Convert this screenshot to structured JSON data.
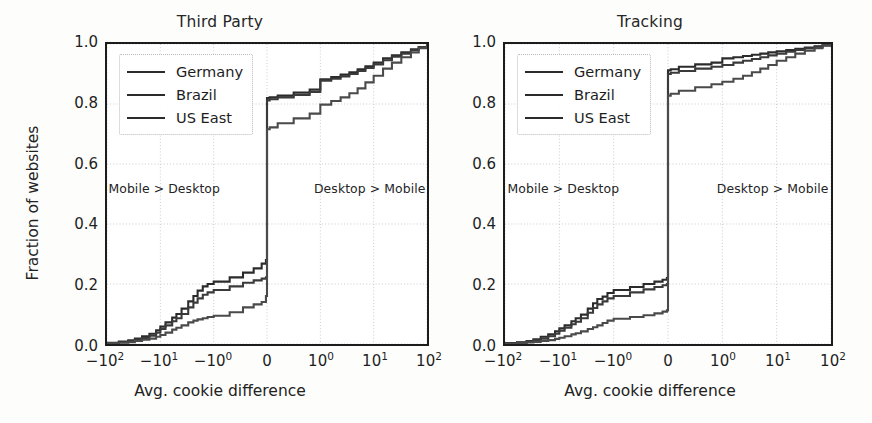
{
  "figure": {
    "width": 872,
    "height": 423,
    "background": "#fdfdfc"
  },
  "chart_data": [
    {
      "type": "line",
      "title": "Third Party",
      "xlabel": "Avg. cookie difference",
      "ylabel": "Fraction of websites",
      "xscale": "symlog",
      "ylim": [
        0.0,
        1.0
      ],
      "xlim": [
        -100,
        100
      ],
      "grid": true,
      "legend_position": "upper left",
      "xticklabels": [
        "−10²",
        "−10¹",
        "−10⁰",
        "0",
        "10⁰",
        "10¹",
        "10²"
      ],
      "xtickvalues": [
        -100,
        -10,
        -1,
        0,
        1,
        10,
        100
      ],
      "yticklabels": [
        "0.0",
        "0.2",
        "0.4",
        "0.6",
        "0.8",
        "1.0"
      ],
      "ytickvalues": [
        0.0,
        0.2,
        0.4,
        0.6,
        0.8,
        1.0
      ],
      "annotations": [
        {
          "text": "Mobile > Desktop",
          "x": -8,
          "y": 0.52
        },
        {
          "text": "Desktop > Mobile",
          "x": 8,
          "y": 0.52
        }
      ],
      "series": [
        {
          "name": "Germany",
          "color": "#2b2b2b",
          "linestyle": "solid",
          "points": [
            [
              -100,
              0.004
            ],
            [
              -60,
              0.008
            ],
            [
              -40,
              0.012
            ],
            [
              -30,
              0.018
            ],
            [
              -22,
              0.026
            ],
            [
              -16,
              0.034
            ],
            [
              -12,
              0.046
            ],
            [
              -10,
              0.058
            ],
            [
              -8,
              0.072
            ],
            [
              -6,
              0.088
            ],
            [
              -5,
              0.1
            ],
            [
              -4,
              0.118
            ],
            [
              -3,
              0.142
            ],
            [
              -2.4,
              0.16
            ],
            [
              -2.0,
              0.178
            ],
            [
              -1.6,
              0.192
            ],
            [
              -1.3,
              0.2
            ],
            [
              -1.0,
              0.208
            ],
            [
              -0.7,
              0.222
            ],
            [
              -0.45,
              0.238
            ],
            [
              -0.25,
              0.252
            ],
            [
              -0.1,
              0.268
            ],
            [
              -0.02,
              0.28
            ],
            [
              0,
              0.82
            ],
            [
              0.05,
              0.822
            ],
            [
              0.2,
              0.828
            ],
            [
              0.5,
              0.838
            ],
            [
              0.8,
              0.848
            ],
            [
              1.0,
              0.882
            ],
            [
              1.6,
              0.89
            ],
            [
              2.4,
              0.898
            ],
            [
              3.5,
              0.906
            ],
            [
              5,
              0.916
            ],
            [
              7,
              0.926
            ],
            [
              10,
              0.938
            ],
            [
              15,
              0.952
            ],
            [
              22,
              0.962
            ],
            [
              33,
              0.972
            ],
            [
              50,
              0.982
            ],
            [
              70,
              0.99
            ],
            [
              100,
              1.0
            ]
          ]
        },
        {
          "name": "Brazil",
          "color": "#3a3a3a",
          "linestyle": "solid",
          "points": [
            [
              -100,
              0.003
            ],
            [
              -60,
              0.006
            ],
            [
              -40,
              0.01
            ],
            [
              -30,
              0.014
            ],
            [
              -22,
              0.02
            ],
            [
              -16,
              0.028
            ],
            [
              -12,
              0.038
            ],
            [
              -10,
              0.05
            ],
            [
              -8,
              0.062
            ],
            [
              -6,
              0.076
            ],
            [
              -5,
              0.086
            ],
            [
              -4,
              0.1
            ],
            [
              -3,
              0.122
            ],
            [
              -2.4,
              0.138
            ],
            [
              -2.0,
              0.152
            ],
            [
              -1.6,
              0.164
            ],
            [
              -1.3,
              0.172
            ],
            [
              -1.0,
              0.18
            ],
            [
              -0.7,
              0.192
            ],
            [
              -0.45,
              0.204
            ],
            [
              -0.25,
              0.212
            ],
            [
              -0.1,
              0.218
            ],
            [
              -0.02,
              0.222
            ],
            [
              0,
              0.812
            ],
            [
              0.05,
              0.816
            ],
            [
              0.2,
              0.822
            ],
            [
              0.5,
              0.83
            ],
            [
              0.8,
              0.84
            ],
            [
              1.0,
              0.878
            ],
            [
              1.6,
              0.884
            ],
            [
              2.4,
              0.892
            ],
            [
              3.5,
              0.9
            ],
            [
              5,
              0.91
            ],
            [
              7,
              0.92
            ],
            [
              10,
              0.932
            ],
            [
              15,
              0.946
            ],
            [
              22,
              0.958
            ],
            [
              33,
              0.968
            ],
            [
              50,
              0.98
            ],
            [
              70,
              0.99
            ],
            [
              100,
              1.0
            ]
          ]
        },
        {
          "name": "US East",
          "color": "#4a4a4a",
          "linestyle": "solid",
          "points": [
            [
              -100,
              0.002
            ],
            [
              -60,
              0.004
            ],
            [
              -40,
              0.006
            ],
            [
              -30,
              0.01
            ],
            [
              -22,
              0.014
            ],
            [
              -16,
              0.018
            ],
            [
              -12,
              0.024
            ],
            [
              -10,
              0.03
            ],
            [
              -8,
              0.038
            ],
            [
              -6,
              0.048
            ],
            [
              -5,
              0.054
            ],
            [
              -4,
              0.062
            ],
            [
              -3,
              0.072
            ],
            [
              -2.4,
              0.078
            ],
            [
              -2.0,
              0.082
            ],
            [
              -1.6,
              0.086
            ],
            [
              -1.3,
              0.09
            ],
            [
              -1.0,
              0.094
            ],
            [
              -0.7,
              0.106
            ],
            [
              -0.45,
              0.122
            ],
            [
              -0.25,
              0.132
            ],
            [
              -0.1,
              0.14
            ],
            [
              -0.02,
              0.16
            ],
            [
              0,
              0.716
            ],
            [
              0.05,
              0.722
            ],
            [
              0.2,
              0.736
            ],
            [
              0.5,
              0.752
            ],
            [
              0.8,
              0.768
            ],
            [
              1.0,
              0.798
            ],
            [
              1.6,
              0.81
            ],
            [
              2.4,
              0.822
            ],
            [
              3.5,
              0.836
            ],
            [
              5,
              0.852
            ],
            [
              7,
              0.872
            ],
            [
              10,
              0.894
            ],
            [
              15,
              0.918
            ],
            [
              22,
              0.938
            ],
            [
              33,
              0.956
            ],
            [
              50,
              0.972
            ],
            [
              70,
              0.986
            ],
            [
              100,
              1.0
            ]
          ]
        }
      ]
    },
    {
      "type": "line",
      "title": "Tracking",
      "xlabel": "Avg. cookie difference",
      "ylabel": "Fraction of websites",
      "xscale": "symlog",
      "ylim": [
        0.0,
        1.0
      ],
      "xlim": [
        -100,
        100
      ],
      "grid": true,
      "legend_position": "upper left",
      "xticklabels": [
        "−10²",
        "−10¹",
        "−10⁰",
        "0",
        "10⁰",
        "10¹",
        "10²"
      ],
      "xtickvalues": [
        -100,
        -10,
        -1,
        0,
        1,
        10,
        100
      ],
      "yticklabels": [
        "0.0",
        "0.2",
        "0.4",
        "0.6",
        "0.8",
        "1.0"
      ],
      "ytickvalues": [
        0.0,
        0.2,
        0.4,
        0.6,
        0.8,
        1.0
      ],
      "annotations": [
        {
          "text": "Mobile > Desktop",
          "x": -8,
          "y": 0.52
        },
        {
          "text": "Desktop > Mobile",
          "x": 8,
          "y": 0.52
        }
      ],
      "series": [
        {
          "name": "Germany",
          "color": "#2b2b2b",
          "linestyle": "solid",
          "points": [
            [
              -100,
              0.003
            ],
            [
              -60,
              0.006
            ],
            [
              -40,
              0.01
            ],
            [
              -30,
              0.016
            ],
            [
              -22,
              0.024
            ],
            [
              -16,
              0.032
            ],
            [
              -12,
              0.042
            ],
            [
              -10,
              0.052
            ],
            [
              -8,
              0.062
            ],
            [
              -6,
              0.076
            ],
            [
              -5,
              0.086
            ],
            [
              -4,
              0.098
            ],
            [
              -3,
              0.118
            ],
            [
              -2.4,
              0.136
            ],
            [
              -2.0,
              0.15
            ],
            [
              -1.6,
              0.158
            ],
            [
              -1.3,
              0.17
            ],
            [
              -1.0,
              0.18
            ],
            [
              -0.7,
              0.19
            ],
            [
              -0.45,
              0.2
            ],
            [
              -0.25,
              0.208
            ],
            [
              -0.1,
              0.214
            ],
            [
              -0.02,
              0.22
            ],
            [
              0,
              0.912
            ],
            [
              0.05,
              0.916
            ],
            [
              0.2,
              0.924
            ],
            [
              0.5,
              0.932
            ],
            [
              0.8,
              0.938
            ],
            [
              1.0,
              0.952
            ],
            [
              1.6,
              0.956
            ],
            [
              2.4,
              0.96
            ],
            [
              3.5,
              0.964
            ],
            [
              5,
              0.968
            ],
            [
              7,
              0.972
            ],
            [
              10,
              0.976
            ],
            [
              15,
              0.98
            ],
            [
              22,
              0.984
            ],
            [
              33,
              0.988
            ],
            [
              50,
              0.992
            ],
            [
              70,
              0.996
            ],
            [
              100,
              1.0
            ]
          ]
        },
        {
          "name": "Brazil",
          "color": "#3a3a3a",
          "linestyle": "solid",
          "points": [
            [
              -100,
              0.002
            ],
            [
              -60,
              0.005
            ],
            [
              -40,
              0.008
            ],
            [
              -30,
              0.012
            ],
            [
              -22,
              0.018
            ],
            [
              -16,
              0.026
            ],
            [
              -12,
              0.034
            ],
            [
              -10,
              0.044
            ],
            [
              -8,
              0.054
            ],
            [
              -6,
              0.066
            ],
            [
              -5,
              0.074
            ],
            [
              -4,
              0.086
            ],
            [
              -3,
              0.104
            ],
            [
              -2.4,
              0.12
            ],
            [
              -2.0,
              0.132
            ],
            [
              -1.6,
              0.142
            ],
            [
              -1.3,
              0.152
            ],
            [
              -1.0,
              0.16
            ],
            [
              -0.7,
              0.172
            ],
            [
              -0.45,
              0.182
            ],
            [
              -0.25,
              0.19
            ],
            [
              -0.1,
              0.196
            ],
            [
              -0.02,
              0.2
            ],
            [
              0,
              0.9
            ],
            [
              0.05,
              0.904
            ],
            [
              0.2,
              0.91
            ],
            [
              0.5,
              0.918
            ],
            [
              0.8,
              0.924
            ],
            [
              1.0,
              0.93
            ],
            [
              1.6,
              0.938
            ],
            [
              2.4,
              0.944
            ],
            [
              3.5,
              0.95
            ],
            [
              5,
              0.956
            ],
            [
              7,
              0.962
            ],
            [
              10,
              0.968
            ],
            [
              15,
              0.974
            ],
            [
              22,
              0.98
            ],
            [
              33,
              0.986
            ],
            [
              50,
              0.991
            ],
            [
              70,
              0.996
            ],
            [
              100,
              1.0
            ]
          ]
        },
        {
          "name": "US East",
          "color": "#4a4a4a",
          "linestyle": "solid",
          "points": [
            [
              -100,
              0.001
            ],
            [
              -60,
              0.003
            ],
            [
              -40,
              0.005
            ],
            [
              -30,
              0.007
            ],
            [
              -22,
              0.01
            ],
            [
              -16,
              0.013
            ],
            [
              -12,
              0.017
            ],
            [
              -10,
              0.021
            ],
            [
              -8,
              0.026
            ],
            [
              -6,
              0.032
            ],
            [
              -5,
              0.036
            ],
            [
              -4,
              0.042
            ],
            [
              -3,
              0.05
            ],
            [
              -2.4,
              0.056
            ],
            [
              -2.0,
              0.062
            ],
            [
              -1.6,
              0.07
            ],
            [
              -1.3,
              0.078
            ],
            [
              -1.0,
              0.084
            ],
            [
              -0.7,
              0.09
            ],
            [
              -0.45,
              0.096
            ],
            [
              -0.25,
              0.102
            ],
            [
              -0.1,
              0.108
            ],
            [
              -0.02,
              0.112
            ],
            [
              0,
              0.828
            ],
            [
              0.05,
              0.834
            ],
            [
              0.2,
              0.844
            ],
            [
              0.5,
              0.856
            ],
            [
              0.8,
              0.866
            ],
            [
              1.0,
              0.874
            ],
            [
              1.6,
              0.884
            ],
            [
              2.4,
              0.894
            ],
            [
              3.5,
              0.906
            ],
            [
              5,
              0.918
            ],
            [
              7,
              0.93
            ],
            [
              10,
              0.944
            ],
            [
              15,
              0.956
            ],
            [
              22,
              0.968
            ],
            [
              33,
              0.978
            ],
            [
              50,
              0.986
            ],
            [
              70,
              0.994
            ],
            [
              100,
              1.0
            ]
          ]
        }
      ]
    }
  ]
}
